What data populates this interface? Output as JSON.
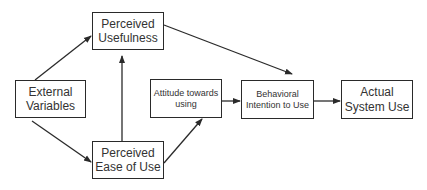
{
  "diagram": {
    "nodes": {
      "perceived_usefulness": {
        "line1": "Perceived",
        "line2": "Usefulness"
      },
      "external_variables": {
        "line1": "External",
        "line2": "Variables"
      },
      "perceived_ease_of_use": {
        "line1": "Perceived",
        "line2": "Ease of Use"
      },
      "attitude_towards_using": {
        "line1": "Attitude towards",
        "line2": "using"
      },
      "behavioral_intention": {
        "line1": "Behavioral",
        "line2": "Intention to Use"
      },
      "actual_system_use": {
        "line1": "Actual",
        "line2": "System Use"
      }
    },
    "edges": [
      {
        "from": "External Variables",
        "to": "Perceived Usefulness"
      },
      {
        "from": "External Variables",
        "to": "Perceived Ease of Use"
      },
      {
        "from": "Perceived Ease of Use",
        "to": "Perceived Usefulness"
      },
      {
        "from": "Perceived Ease of Use",
        "to": "Attitude towards using"
      },
      {
        "from": "Perceived Usefulness",
        "to": "Behavioral Intention to Use"
      },
      {
        "from": "Attitude towards using",
        "to": "Behavioral Intention to Use"
      },
      {
        "from": "Behavioral Intention to Use",
        "to": "Actual System Use"
      }
    ],
    "colors": {
      "line": "#2a2a2a",
      "text": "#333333",
      "background": "#ffffff"
    }
  }
}
